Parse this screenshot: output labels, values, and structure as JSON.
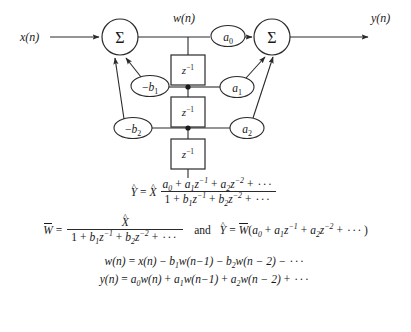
{
  "figure": {
    "diagram": {
      "input_label": "x(n)",
      "output_label": "y(n)",
      "intermediate_label": "w(n)",
      "summer_symbol": "Σ",
      "delay_label_base": "z",
      "delay_label_exp": "-1",
      "nodes": [
        {
          "id": "sum-left",
          "type": "summing-junction",
          "label": "Σ",
          "cx": 120,
          "cy": 37,
          "r": 18
        },
        {
          "id": "sum-right",
          "type": "summing-junction",
          "label": "Σ",
          "cx": 272,
          "cy": 37,
          "r": 18
        },
        {
          "id": "gain-a0",
          "type": "gain",
          "label": "a0",
          "base": "a",
          "sub": "0",
          "cx": 228,
          "cy": 36,
          "rx": 17,
          "ry": 10
        },
        {
          "id": "gain-a1",
          "type": "gain",
          "label": "a1",
          "base": "a",
          "sub": "1",
          "cx": 237,
          "cy": 87,
          "rx": 17,
          "ry": 10
        },
        {
          "id": "gain-a2",
          "type": "gain",
          "label": "a2",
          "base": "a",
          "sub": "2",
          "cx": 247,
          "cy": 128,
          "rx": 17,
          "ry": 10
        },
        {
          "id": "gain-b1",
          "type": "gain",
          "label": "-b1",
          "base": "−b",
          "sub": "1",
          "cx": 150,
          "cy": 86,
          "rx": 19,
          "ry": 10
        },
        {
          "id": "gain-b2",
          "type": "gain",
          "label": "-b2",
          "base": "−b",
          "sub": "2",
          "cx": 133,
          "cy": 128,
          "rx": 19,
          "ry": 10
        },
        {
          "id": "delay-1",
          "type": "delay-block",
          "label": "z^-1",
          "x": 171,
          "y": 55,
          "w": 33,
          "h": 30
        },
        {
          "id": "delay-2",
          "type": "delay-block",
          "label": "z^-1",
          "x": 171,
          "y": 97,
          "w": 33,
          "h": 30
        },
        {
          "id": "delay-3",
          "type": "delay-block",
          "label": "z^-1",
          "x": 171,
          "y": 139,
          "w": 33,
          "h": 30
        }
      ],
      "tap_points": [
        {
          "id": "tap-1",
          "cx": 188,
          "cy": 87
        },
        {
          "id": "tap-2",
          "cx": 188,
          "cy": 128
        }
      ]
    },
    "equations": [
      {
        "id": "eq-transfer-function",
        "text": "Y-hat = X-hat (a0 + a1 z^-1 + a2 z^-2 + ...) / (1 + b1 z^-1 + b2 z^-2 + ...)",
        "lhs": "Ŷ",
        "equals": "=",
        "xhat": "X̂",
        "numerator": "a0 + a1 z^-1 + a2 z^-2 + ···",
        "denominator": "1 + b1 z^-1 + b2 z^-2 + ···"
      },
      {
        "id": "eq-w-transform",
        "text": "W-bar = X-hat / (1 + b1 z^-1 + b2 z^-2 + ...)   and   Y-hat = W-bar (a0 + a1 z^-1 + a2 z^-2 + ...)",
        "conjunction": "and"
      },
      {
        "id": "eq-w-difference",
        "text": "w(n) = x(n) − b1 w(n−1) − b2 w(n − 2) − ···"
      },
      {
        "id": "eq-y-difference",
        "text": "y(n) = a0 w(n) + a1 w(n−1) + a2 w(n − 2) + ···"
      }
    ],
    "symbols": {
      "minus": "−",
      "plus": "+",
      "equals": "=",
      "ellipsis": "···",
      "one": "1",
      "var_a": "a",
      "var_b": "b",
      "var_z": "z",
      "var_w": "w",
      "var_x": "x",
      "var_y": "y",
      "var_n": "n",
      "sub_0": "0",
      "sub_1": "1",
      "sub_2": "2",
      "exp_m1": "−1",
      "exp_m2": "−2",
      "n_minus_1": "n−1",
      "n_minus_2": "n − 2",
      "and_word": "and"
    },
    "colors": {
      "background": "#ffffff",
      "stroke": "#2a2a2a",
      "text": "#1a1a1a",
      "node_fill": "#ffffff"
    }
  }
}
